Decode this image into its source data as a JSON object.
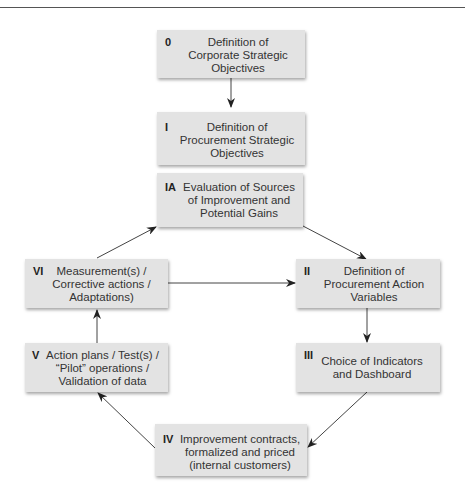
{
  "diagram": {
    "boxes": [
      {
        "id": "0",
        "label_num": "0",
        "lines": [
          "Definition of",
          "Corporate Strategic",
          "Objectives"
        ]
      },
      {
        "id": "I",
        "label_num": "I",
        "lines": [
          "Definition of",
          "Procurement Strategic",
          "Objectives"
        ]
      },
      {
        "id": "IA",
        "label_num": "IA",
        "lines": [
          "Evaluation of Sources",
          "of Improvement and",
          "Potential Gains"
        ]
      },
      {
        "id": "II",
        "label_num": "II",
        "lines": [
          "Definition of",
          "Procurement Action",
          "Variables"
        ]
      },
      {
        "id": "III",
        "label_num": "III",
        "lines": [
          "Choice of Indicators",
          "and Dashboard"
        ]
      },
      {
        "id": "IV",
        "label_num": "IV",
        "lines": [
          "Improvement contracts,",
          "formalized and priced",
          "(internal customers)"
        ]
      },
      {
        "id": "V",
        "label_num": "V",
        "lines": [
          "Action plans / Test(s) /",
          "“Pilot” operations /",
          "Validation of data"
        ]
      },
      {
        "id": "VI",
        "label_num": "VI",
        "lines": [
          "Measurement(s) /",
          "Corrective actions /",
          "Adaptations)"
        ]
      }
    ],
    "edges": [
      {
        "from": "0",
        "to": "I"
      },
      {
        "from": "VI",
        "to": "IA"
      },
      {
        "from": "IA",
        "to": "II"
      },
      {
        "from": "VI",
        "to": "II"
      },
      {
        "from": "II",
        "to": "III"
      },
      {
        "from": "III",
        "to": "IV"
      },
      {
        "from": "IV",
        "to": "V"
      },
      {
        "from": "V",
        "to": "VI"
      }
    ],
    "colors": {
      "box_fill": "#e3e3e3",
      "arrow": "#333333",
      "text": "#333333"
    }
  }
}
